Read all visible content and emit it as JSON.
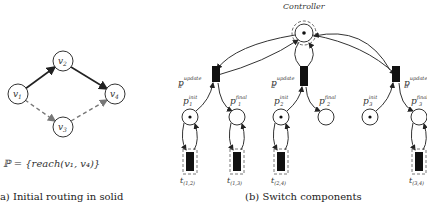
{
  "figure_a": {
    "nodes": [
      {
        "id": "v1",
        "label": "v",
        "sub": "1",
        "x": 18,
        "y": 94
      },
      {
        "id": "v2",
        "label": "v",
        "sub": "2",
        "x": 63,
        "y": 61
      },
      {
        "id": "v3",
        "label": "v",
        "sub": "3",
        "x": 63,
        "y": 127
      },
      {
        "id": "v4",
        "label": "v",
        "sub": "4",
        "x": 115,
        "y": 94
      }
    ],
    "edges": [
      {
        "from": "v1",
        "to": "v2",
        "style": "solid"
      },
      {
        "from": "v2",
        "to": "v4",
        "style": "solid"
      },
      {
        "from": "v1",
        "to": "v3",
        "style": "dashed"
      },
      {
        "from": "v3",
        "to": "v4",
        "style": "dashed"
      }
    ],
    "policy": "ℙ = {reach(v₁, v₄)}",
    "caption": "(a) Initial routing in solid"
  },
  "figure_b": {
    "controller_label": "Controller",
    "update_places": [
      {
        "id": "p1_update",
        "label": "p",
        "sub": "1",
        "sup": "update"
      },
      {
        "id": "p2_update",
        "label": "p",
        "sub": "2",
        "sup": "update"
      },
      {
        "id": "p3_update",
        "label": "p",
        "sub": "3",
        "sup": "update"
      }
    ],
    "places": [
      {
        "id": "p1_init",
        "label": "p",
        "sub": "1",
        "sup": "init",
        "token": true
      },
      {
        "id": "p1_final",
        "label": "p",
        "sub": "1",
        "sup": "final",
        "token": false
      },
      {
        "id": "p2_init",
        "label": "p",
        "sub": "2",
        "sup": "init",
        "token": true
      },
      {
        "id": "p2_final",
        "label": "p",
        "sub": "2",
        "sup": "final",
        "token": false
      },
      {
        "id": "p3_init",
        "label": "p",
        "sub": "3",
        "sup": "init",
        "token": true
      },
      {
        "id": "p3_final",
        "label": "p",
        "sub": "3",
        "sup": "final",
        "token": false
      }
    ],
    "transitions": [
      {
        "id": "t12",
        "label": "t",
        "sub": "(1,2)"
      },
      {
        "id": "t13",
        "label": "t",
        "sub": "(1,3)"
      },
      {
        "id": "t24",
        "label": "t",
        "sub": "(2,4)"
      },
      {
        "id": "t34",
        "label": "t",
        "sub": "(3,4)"
      }
    ],
    "caption": "(b) Switch components"
  }
}
